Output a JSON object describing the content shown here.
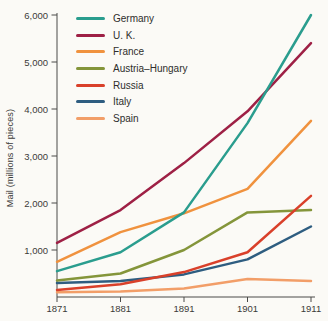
{
  "figure": {
    "background": "#fbfaf6",
    "axis_color": "#4a4a48",
    "text_color": "#3b3b39"
  },
  "chart_data": {
    "type": "line",
    "title": "",
    "xlabel": "",
    "ylabel": "Mail (millions of pieces)",
    "x": [
      1871,
      1881,
      1891,
      1901,
      1911
    ],
    "x_tick_labels": [
      "1871",
      "1881",
      "1891",
      "1901",
      "1911"
    ],
    "y_ticks": [
      1000,
      2000,
      3000,
      4000,
      5000,
      6000
    ],
    "y_tick_labels": [
      "1,000",
      "2,000",
      "3,000",
      "4,000",
      "5,000",
      "6,000"
    ],
    "ylim": [
      0,
      6300
    ],
    "grid": false,
    "legend_position": "top-left-inside",
    "series": [
      {
        "name": "Germany",
        "color": "#2a9d8e",
        "values": [
          550,
          950,
          1800,
          3700,
          6000
        ]
      },
      {
        "name": "U. K.",
        "color": "#9e2045",
        "values": [
          1150,
          1850,
          2850,
          3950,
          5400
        ]
      },
      {
        "name": "France",
        "color": "#f0923e",
        "values": [
          750,
          1380,
          1780,
          2300,
          3750
        ]
      },
      {
        "name": "Austria–Hungary",
        "color": "#84953a",
        "values": [
          350,
          500,
          1000,
          1800,
          1850
        ]
      },
      {
        "name": "Russia",
        "color": "#d9402a",
        "values": [
          150,
          270,
          530,
          950,
          2150
        ]
      },
      {
        "name": "Italy",
        "color": "#2e5d80",
        "values": [
          300,
          340,
          480,
          800,
          1500
        ]
      },
      {
        "name": "Spain",
        "color": "#f29e68",
        "values": [
          100,
          120,
          180,
          380,
          340
        ]
      }
    ],
    "draw_order": [
      "Spain",
      "Italy",
      "Austria–Hungary",
      "Russia",
      "France",
      "U. K.",
      "Germany"
    ]
  }
}
